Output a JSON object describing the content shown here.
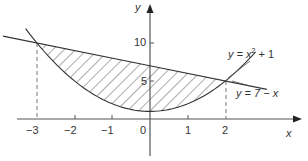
{
  "chart_data": {
    "type": "line",
    "title": "",
    "xlabel": "x",
    "ylabel": "y",
    "x_ticks": [
      "−3",
      "−2",
      "−1",
      "0",
      "1",
      "2"
    ],
    "y_ticks": [
      "5",
      "10"
    ],
    "xlim": [
      -3.9,
      4.5
    ],
    "ylim": [
      -5.5,
      14
    ],
    "series": [
      {
        "name": "y = x² + 1",
        "expression": "x^2 + 1",
        "x": [
          -3.3,
          -3,
          -2,
          -1,
          0,
          1,
          2,
          2.8
        ],
        "values": [
          11.89,
          10,
          5,
          2,
          1,
          2,
          5,
          8.84
        ]
      },
      {
        "name": "y = 7 − x",
        "expression": "7 - x",
        "x": [
          -3.9,
          -3,
          0,
          2,
          3.1
        ],
        "values": [
          10.9,
          10,
          7,
          5,
          3.9
        ]
      }
    ],
    "shaded_region": {
      "between": [
        "y = 7 − x",
        "y = x² + 1"
      ],
      "x_range": [
        -3,
        2
      ],
      "pattern": "diagonal hatching"
    },
    "intersections": [
      {
        "x": -3,
        "y": 10
      },
      {
        "x": 2,
        "y": 5
      }
    ],
    "annotations": [
      "dashed vertical line at x = −3",
      "dashed vertical line at x = 2"
    ],
    "grid": false
  },
  "labels": {
    "axis_x": "x",
    "axis_y": "y",
    "origin": "0",
    "tick_x_m3": "−3",
    "tick_x_m2": "−2",
    "tick_x_m1": "−1",
    "tick_x_1": "1",
    "tick_x_2": "2",
    "tick_y_5": "5",
    "tick_y_10": "10",
    "curve_parabola_prefix": "y = x",
    "curve_parabola_exp": "2",
    "curve_parabola_suffix": " + 1",
    "curve_line": "y = 7 − x"
  }
}
